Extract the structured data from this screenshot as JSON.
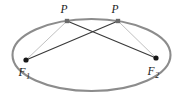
{
  "figure": {
    "kind": "geometry-diagram",
    "background_color": "#ffffff"
  },
  "chart_data": {
    "type": "scatter",
    "title": "",
    "xlabel": "",
    "ylabel": "",
    "grid": false,
    "legend": null,
    "xlim": [
      0,
      181
    ],
    "ylim": [
      104,
      0
    ],
    "ellipse": {
      "center_x": 91.5,
      "center_y": 55,
      "radius_x": 79,
      "radius_y": 36,
      "stroke_color": "#8c8c8c",
      "stroke_width": 2.1,
      "fill": "none"
    },
    "points": [
      {
        "id": "F1",
        "label": "F",
        "subscript": "1",
        "x": 26,
        "y": 60,
        "marker": "filled-circle",
        "radius": 2.6,
        "color": "#171717",
        "label_x": 24,
        "label_y": 74
      },
      {
        "id": "F2",
        "label": "F",
        "subscript": "2",
        "x": 156,
        "y": 58,
        "marker": "filled-circle",
        "radius": 2.6,
        "color": "#171717",
        "label_x": 152,
        "label_y": 73
      },
      {
        "id": "P_left",
        "label": "P",
        "subscript": "",
        "x": 67,
        "y": 21,
        "marker": "filled-square",
        "radius": 1.9,
        "color": "#6b6b6b",
        "label_x": 64,
        "label_y": 13
      },
      {
        "id": "P_right",
        "label": "P",
        "subscript": "",
        "x": 118,
        "y": 21,
        "marker": "filled-square",
        "radius": 1.9,
        "color": "#6b6b6b",
        "label_x": 115,
        "label_y": 13
      }
    ],
    "segments": [
      {
        "id": "F1-to-P-left",
        "from": "F1",
        "to": "P_left",
        "x1": 26,
        "y1": 60,
        "x2": 67,
        "y2": 21,
        "stroke_color": "#b0b0b0",
        "stroke_width": 0.8
      },
      {
        "id": "F2-to-P-right",
        "from": "F2",
        "to": "P_right",
        "x1": 156,
        "y1": 58,
        "x2": 118,
        "y2": 21,
        "stroke_color": "#b0b0b0",
        "stroke_width": 0.8
      },
      {
        "id": "F1-to-P-right",
        "from": "F1",
        "to": "P_right",
        "x1": 26,
        "y1": 60,
        "x2": 118,
        "y2": 21,
        "stroke_color": "#3a3a3a",
        "stroke_width": 1.2
      },
      {
        "id": "F2-to-P-left",
        "from": "F2",
        "to": "P_left",
        "x1": 156,
        "y1": 58,
        "x2": 67,
        "y2": 21,
        "stroke_color": "#3a3a3a",
        "stroke_width": 1.2
      }
    ],
    "labels": {
      "focus_one": "F",
      "focus_one_subscript": "1",
      "focus_two": "F",
      "focus_two_subscript": "2",
      "point_left": "P",
      "point_right": "P"
    },
    "colors": {
      "ellipse_stroke": "#8c8c8c",
      "ray_light": "#b0b0b0",
      "ray_dark": "#3a3a3a",
      "focus_dot": "#171717",
      "point_marker": "#6b6b6b",
      "text": "#1a1a1a"
    }
  }
}
